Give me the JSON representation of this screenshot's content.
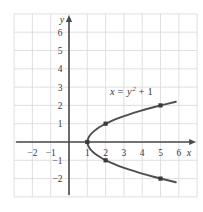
{
  "figure": {
    "background_color": "#ffffff",
    "grid_color": "#d8d8dc",
    "axis_color": "#4a4a4e",
    "curve_color": "#4d4d52",
    "point_color": "#3a3a3c",
    "label_color": "#3a3a3c"
  },
  "chart_data": {
    "type": "line",
    "title": "",
    "subtitle": "",
    "xlabel": "x",
    "ylabel": "y",
    "equation": "x = y^2 + 1",
    "equation_parts": {
      "lhs": "x",
      "equals": "=",
      "base": "y",
      "exponent": "2",
      "plus": "+",
      "constant": "1"
    },
    "annotation_text": "x = y² + 1",
    "xlim": [
      -3,
      7
    ],
    "ylim": [
      -3,
      7
    ],
    "grid": true,
    "grid_step": 1,
    "legend": "none",
    "xticks": [
      -2,
      -1,
      1,
      2,
      3,
      4,
      5,
      6
    ],
    "xtick_labels": [
      "−2",
      "−1",
      "1",
      "2",
      "3",
      "4",
      "5",
      "6"
    ],
    "yticks": [
      6,
      5,
      4,
      3,
      2,
      1,
      -1,
      -2
    ],
    "ytick_labels": [
      "6",
      "5",
      "4",
      "3",
      "2",
      "1",
      "−1",
      "−2"
    ],
    "curve": {
      "name": "x = y^2 + 1",
      "orientation": "opens-right",
      "vertex": [
        1,
        0
      ],
      "y_range": [
        -2.2,
        2.2
      ],
      "x": [
        5.84,
        5.0,
        4.24,
        3.56,
        2.96,
        2.44,
        2.0,
        1.64,
        1.36,
        1.16,
        1.04,
        1.0,
        1.04,
        1.16,
        1.36,
        1.64,
        2.0,
        2.44,
        2.96,
        3.56,
        4.24,
        5.0,
        5.84
      ],
      "y": [
        -2.2,
        -2.0,
        -1.8,
        -1.6,
        -1.4,
        -1.2,
        -1.0,
        -0.8,
        -0.6,
        -0.4,
        -0.2,
        0.0,
        0.2,
        0.4,
        0.6,
        0.8,
        1.0,
        1.2,
        1.4,
        1.6,
        1.8,
        2.0,
        2.2
      ]
    },
    "points": [
      {
        "x": 1,
        "y": 0
      },
      {
        "x": 2,
        "y": 1
      },
      {
        "x": 5,
        "y": 2
      },
      {
        "x": 2,
        "y": -1
      },
      {
        "x": 5,
        "y": -2
      }
    ]
  }
}
